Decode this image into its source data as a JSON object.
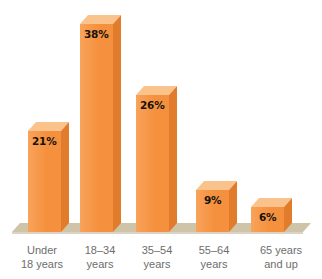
{
  "chart_data": {
    "type": "bar",
    "title": "",
    "subtitle": "",
    "xlabel": "",
    "ylabel": "",
    "categories": [
      "Under 18 years",
      "18–34 years",
      "35–54 years",
      "55–64 years",
      "65 years and up"
    ],
    "category_lines": [
      [
        "Under",
        "18 years"
      ],
      [
        "18–34",
        "years"
      ],
      [
        "35–54",
        "years"
      ],
      [
        "55–64",
        "years"
      ],
      [
        "65 years",
        "and up"
      ]
    ],
    "values": [
      21,
      38,
      26,
      9,
      6
    ],
    "value_labels": [
      "21%",
      "38%",
      "26%",
      "9%",
      "6%"
    ],
    "unit": "%",
    "ylim": [
      0,
      40
    ],
    "grid": false,
    "legend": false,
    "legend_position": "none",
    "style": "3d-column",
    "annotations": []
  },
  "colors": {
    "background": "#ffffff",
    "bar_front": "#f5913e",
    "bar_front_light": "#f8a35b",
    "bar_top": "#fbc38c",
    "bar_side": "#e07c2c",
    "ground": "#cfc4a8",
    "ground_shadow": "#bdb093",
    "value_text": "#17120c",
    "category_text": "#6d6d6d"
  },
  "geometry": {
    "baseline_y": 232,
    "depth_x": 8,
    "depth_y": 9,
    "bar_width": 33,
    "bar_left_x": [
      28,
      80,
      136,
      196,
      251
    ],
    "bar_top_y": [
      131,
      24,
      95,
      190,
      207
    ]
  }
}
